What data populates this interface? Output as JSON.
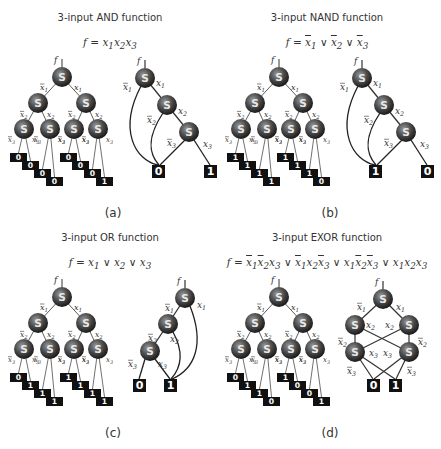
{
  "panels": [
    {
      "id": "a",
      "title": "3-input AND function",
      "formula_html": "f = x<sub>1</sub>x<sub>2</sub>x<sub>3</sub>",
      "caption": "(a)",
      "tree_leaves": [
        "0",
        "0",
        "0",
        "0",
        "0",
        "0",
        "0",
        "1"
      ],
      "reduced_type": "chain_and",
      "reduced_leaves": [
        "0",
        "1"
      ]
    },
    {
      "id": "b",
      "title": "3-input NAND function",
      "formula_html": "f = <span class='ov'>x</span><sub>1</sub> ∨ <span class='ov'>x</span><sub>2</sub> ∨ <span class='ov'>x</span><sub>3</sub>",
      "caption": "(b)",
      "tree_leaves": [
        "1",
        "1",
        "1",
        "1",
        "1",
        "1",
        "1",
        "0"
      ],
      "reduced_type": "chain_and",
      "reduced_leaves": [
        "1",
        "0"
      ]
    },
    {
      "id": "c",
      "title": "3-input OR function",
      "formula_html": "f = x<sub>1</sub> ∨ x<sub>2</sub> ∨ x<sub>3</sub>",
      "caption": "(c)",
      "tree_leaves": [
        "0",
        "1",
        "1",
        "1",
        "1",
        "1",
        "1",
        "1"
      ],
      "reduced_type": "chain_or",
      "reduced_leaves": [
        "0",
        "1"
      ]
    },
    {
      "id": "d",
      "title": "3-input EXOR function",
      "formula_html": "f = <span class='ov'>x</span><sub>1</sub><span class='ov'>x</span><sub>2</sub>x<sub>3</sub> ∨ <span class='ov'>x</span><sub>1</sub>x<sub>2</sub><span class='ov'>x</span><sub>3</sub> ∨ x<sub>1</sub><span class='ov'>x</span><sub>2</sub><span class='ov'>x</span><sub>3</sub> ∨ x<sub>1</sub>x<sub>2</sub>x<sub>3</sub>",
      "caption": "(d)",
      "tree_leaves": [
        "0",
        "1",
        "1",
        "0",
        "1",
        "0",
        "0",
        "1"
      ],
      "reduced_type": "lattice_xor",
      "reduced_leaves": [
        "0",
        "1"
      ]
    }
  ],
  "node_label": "S",
  "output_label": "f",
  "colors": {
    "node_dark": "#1a1a1a",
    "node_light": "#9a9a9a",
    "leaf": "#111111",
    "line": "#333333"
  }
}
